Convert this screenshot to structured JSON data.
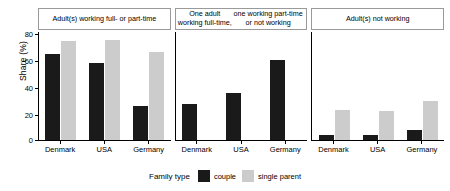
{
  "chart_data": {
    "type": "bar",
    "title": "",
    "xlabel": "",
    "ylabel": "Share (%)",
    "ylim": [
      0,
      85
    ],
    "yticks": [
      0,
      20,
      40,
      60,
      80
    ],
    "grid": false,
    "legend_position": "bottom",
    "legend_title": "Family type",
    "categories": [
      "Denmark",
      "USA",
      "Germany"
    ],
    "series": [
      {
        "name": "couple",
        "color": "#1a1a1a"
      },
      {
        "name": "single parent",
        "color": "#cccccc"
      }
    ],
    "facets": [
      {
        "title": "Adult(s) working full- or part-time",
        "values": {
          "couple": [
            68,
            61,
            27
          ],
          "single parent": [
            78,
            79,
            69
          ]
        }
      },
      {
        "title": "One adult working full-time,\none working part-time or not working",
        "values": {
          "couple": [
            28,
            37,
            63
          ],
          "single parent": [
            null,
            null,
            null
          ]
        }
      },
      {
        "title": "Adult(s) not working",
        "values": {
          "couple": [
            4,
            4,
            8
          ],
          "single parent": [
            24,
            23,
            31
          ]
        }
      }
    ]
  },
  "axis": {
    "y_title": "Share (%)",
    "y_ticks": [
      "80",
      "60",
      "40",
      "20",
      "0"
    ],
    "x_labels": [
      "Denmark",
      "USA",
      "Germany"
    ]
  },
  "facet_titles": {
    "panel1": "Adult(s) working full- or part-time",
    "panel2_line1": "One adult working full-time,",
    "panel2_line2": "one working part-time or not working",
    "panel3": "Adult(s) not working"
  },
  "legend": {
    "title": "Family type",
    "couple_label": "couple",
    "single_label": "single parent"
  }
}
